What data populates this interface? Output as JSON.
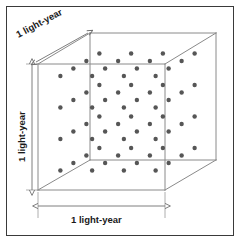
{
  "figure": {
    "frame": {
      "border_color": "#3a3a3a",
      "background": "#ffffff"
    },
    "cube": {
      "edge_color": "#8a8a8a",
      "front_face": {
        "top_left": [
          38,
          64
        ],
        "top_right": [
          165,
          64
        ],
        "bottom_right": [
          165,
          190
        ],
        "bottom_left": [
          38,
          190
        ]
      },
      "back_face": {
        "top_left": [
          90,
          33
        ],
        "top_right": [
          216,
          33
        ],
        "bottom_right": [
          216,
          160
        ],
        "bottom_left": [
          90,
          160
        ]
      }
    },
    "dots": {
      "color": "#565656",
      "radius": 2.2,
      "lattice": "4 x 4 x 4",
      "count": 64,
      "nx": 4,
      "ny": 4,
      "nz": 4
    },
    "dimensions": [
      {
        "id": "depth",
        "label": "1 light-year",
        "axis": "depth",
        "arrow": "double",
        "from": [
          36,
          62
        ],
        "to": [
          88,
          33
        ]
      },
      {
        "id": "height",
        "label": "1 light-year",
        "axis": "height",
        "arrow": "double",
        "from": [
          32,
          64
        ],
        "to": [
          32,
          190
        ]
      },
      {
        "id": "width",
        "label": "1 light-year",
        "axis": "width",
        "arrow": "double",
        "from": [
          38,
          206
        ],
        "to": [
          165,
          206
        ]
      }
    ],
    "guide_color": "#8a8a8a"
  },
  "labels": {
    "depth": "1 light-year",
    "height": "1 light-year",
    "width": "1 light-year"
  }
}
